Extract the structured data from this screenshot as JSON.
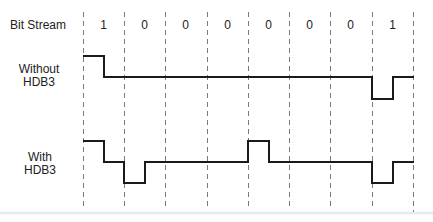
{
  "diagram": {
    "type": "HDB3 line coding timing diagram",
    "rows": {
      "bitstream": {
        "label": "Bit Stream"
      },
      "without": {
        "label_line1": "Without",
        "label_line2": "HDB3"
      },
      "with": {
        "label_line1": "With",
        "label_line2": "HDB3"
      }
    },
    "bits": [
      "1",
      "0",
      "0",
      "0",
      "0",
      "0",
      "0",
      "1"
    ],
    "bit_boundaries_x": [
      83,
      124,
      165,
      207,
      248,
      289,
      330,
      372,
      413
    ],
    "levels": {
      "high": 1,
      "zero": 0,
      "low": -1
    },
    "waveforms": {
      "without_hdb3": {
        "description": "Signal per bit interval (first/second half levels)",
        "segments": [
          {
            "bit": "1",
            "first_half": 1,
            "second_half": 0
          },
          {
            "bit": "0",
            "first_half": 0,
            "second_half": 0
          },
          {
            "bit": "0",
            "first_half": 0,
            "second_half": 0
          },
          {
            "bit": "0",
            "first_half": 0,
            "second_half": 0
          },
          {
            "bit": "0",
            "first_half": 0,
            "second_half": 0
          },
          {
            "bit": "0",
            "first_half": 0,
            "second_half": 0
          },
          {
            "bit": "0",
            "first_half": 0,
            "second_half": 0
          },
          {
            "bit": "1",
            "first_half": -1,
            "second_half": 0
          }
        ]
      },
      "with_hdb3": {
        "description": "Signal per bit interval (first/second half levels)",
        "segments": [
          {
            "bit": "1",
            "first_half": 1,
            "second_half": 0
          },
          {
            "bit": "0",
            "first_half": -1,
            "second_half": 0
          },
          {
            "bit": "0",
            "first_half": 0,
            "second_half": 0
          },
          {
            "bit": "0",
            "first_half": 0,
            "second_half": 0
          },
          {
            "bit": "0",
            "first_half": 1,
            "second_half": 0
          },
          {
            "bit": "0",
            "first_half": 0,
            "second_half": 0
          },
          {
            "bit": "0",
            "first_half": 0,
            "second_half": 0
          },
          {
            "bit": "1",
            "first_half": -1,
            "second_half": 0
          }
        ]
      }
    },
    "colors": {
      "signal": "#1a1a1a",
      "grid_dash": "#777777",
      "text": "#222222",
      "background": "#ffffff"
    }
  }
}
